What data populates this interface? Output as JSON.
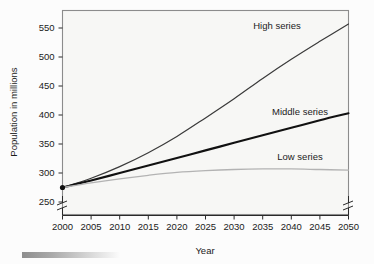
{
  "chart_data": {
    "type": "line",
    "title": "",
    "xlabel": "Year",
    "ylabel": "Population in millions",
    "xlim": [
      2000,
      2050
    ],
    "ylim": [
      250,
      565
    ],
    "grid": false,
    "legend_position": "inline-end-of-line",
    "axis_break": {
      "y_break_below": 250,
      "x_break_at_ends": true
    },
    "x_ticks": [
      "2000",
      "2005",
      "2010",
      "2015",
      "2020",
      "2025",
      "2030",
      "2035",
      "2040",
      "2045",
      "2050"
    ],
    "y_ticks": [
      "250",
      "300",
      "350",
      "400",
      "450",
      "500",
      "550"
    ],
    "x": [
      2000,
      2005,
      2010,
      2015,
      2020,
      2025,
      2030,
      2035,
      2040,
      2045,
      2050
    ],
    "series": [
      {
        "name": "High series",
        "label": "High series",
        "color": "#3a3a3a",
        "width": 1.2,
        "values": [
          275,
          291,
          311,
          335,
          363,
          395,
          428,
          463,
          496,
          527,
          557
        ]
      },
      {
        "name": "Middle series",
        "label": "Middle series",
        "color": "#111111",
        "width": 2.1,
        "values": [
          275,
          287,
          300,
          313,
          326,
          339,
          352,
          365,
          378,
          391,
          403
        ]
      },
      {
        "name": "Low series",
        "label": "Low series",
        "color": "#b3b3b3",
        "width": 1.3,
        "values": [
          275,
          283,
          290,
          296,
          301,
          304,
          306,
          307,
          307,
          306,
          305
        ]
      }
    ],
    "origin_marker": {
      "x": 2000,
      "y": 275,
      "visible": true
    },
    "colors": {
      "plot_background": "#f7f7f5",
      "frame": "#8c8c8c",
      "axis": "#2a2a2a",
      "text": "#1b1b1b"
    }
  },
  "labels": {
    "high": "High series",
    "middle": "Middle series",
    "low": "Low series",
    "x_axis_title": "Year",
    "y_axis_title": "Population in millions"
  }
}
